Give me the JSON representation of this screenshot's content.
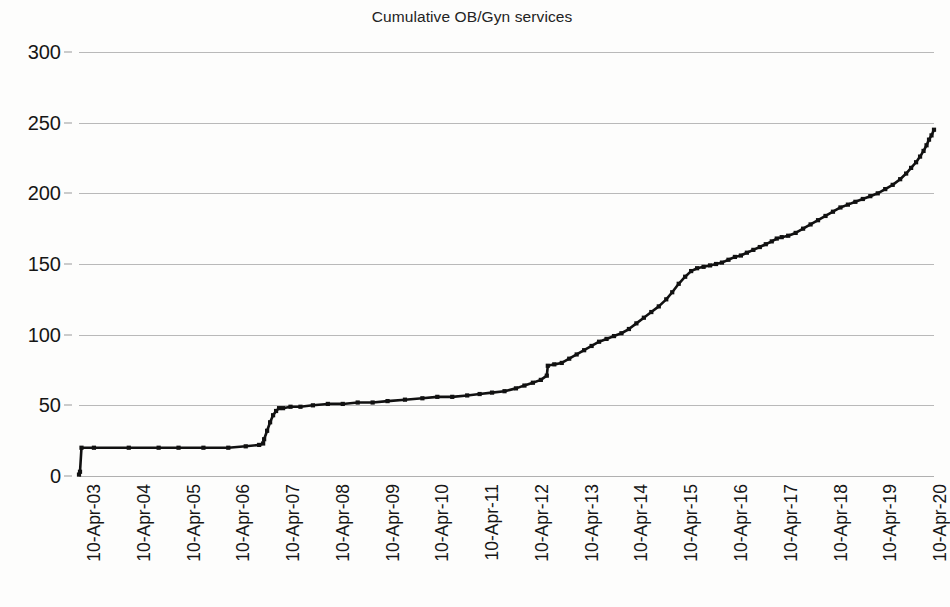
{
  "chart_data": {
    "type": "line",
    "title": "Cumulative OB/Gyn services",
    "xlabel": "",
    "ylabel": "",
    "ylim": [
      0,
      300
    ],
    "ytick_labels": [
      "0",
      "50",
      "100",
      "150",
      "200",
      "250",
      "300"
    ],
    "ytick_values": [
      0,
      50,
      100,
      150,
      200,
      250,
      300
    ],
    "grid": true,
    "legend": false,
    "legend_position": "none",
    "xlim": [
      "10-Apr-03",
      "10-Apr-20"
    ],
    "xtick_labels": [
      "10-Apr-03",
      "10-Apr-04",
      "10-Apr-05",
      "10-Apr-06",
      "10-Apr-07",
      "10-Apr-08",
      "10-Apr-09",
      "10-Apr-10",
      "10-Apr-11",
      "10-Apr-12",
      "10-Apr-13",
      "10-Apr-14",
      "10-Apr-15",
      "10-Apr-16",
      "10-Apr-17",
      "10-Apr-18",
      "10-Apr-19",
      "10-Apr-20"
    ],
    "series": [
      {
        "name": "Cumulative OB/Gyn services",
        "color": "#111111",
        "marker": "square",
        "x": [
          2003.0,
          2003.02,
          2003.05,
          2003.3,
          2004.0,
          2004.6,
          2005.0,
          2005.5,
          2006.0,
          2006.35,
          2006.62,
          2006.7,
          2006.72,
          2006.78,
          2006.84,
          2006.9,
          2006.96,
          2007.02,
          2007.1,
          2007.25,
          2007.45,
          2007.7,
          2008.0,
          2008.3,
          2008.6,
          2008.9,
          2009.2,
          2009.55,
          2009.9,
          2010.2,
          2010.5,
          2010.8,
          2011.05,
          2011.3,
          2011.55,
          2011.78,
          2011.95,
          2012.12,
          2012.28,
          2012.4,
          2012.42,
          2012.55,
          2012.7,
          2012.85,
          2013.0,
          2013.15,
          2013.3,
          2013.45,
          2013.6,
          2013.75,
          2013.9,
          2014.05,
          2014.2,
          2014.35,
          2014.5,
          2014.65,
          2014.8,
          2014.92,
          2015.05,
          2015.18,
          2015.3,
          2015.42,
          2015.55,
          2015.68,
          2015.8,
          2015.92,
          2016.05,
          2016.18,
          2016.3,
          2016.42,
          2016.55,
          2016.68,
          2016.8,
          2016.92,
          2017.02,
          2017.12,
          2017.25,
          2017.4,
          2017.55,
          2017.7,
          2017.85,
          2018.0,
          2018.15,
          2018.3,
          2018.45,
          2018.6,
          2018.75,
          2018.9,
          2019.05,
          2019.2,
          2019.35,
          2019.5,
          2019.62,
          2019.72,
          2019.82,
          2019.9,
          2019.97,
          2020.03,
          2020.08,
          2020.13,
          2020.18
        ],
        "y": [
          1,
          3,
          20,
          20,
          20,
          20,
          20,
          20,
          20,
          21,
          22,
          23,
          26,
          32,
          38,
          43,
          46,
          48,
          48,
          49,
          49,
          50,
          51,
          51,
          52,
          52,
          53,
          54,
          55,
          56,
          56,
          57,
          58,
          59,
          60,
          62,
          64,
          66,
          68,
          71,
          78,
          79,
          80,
          83,
          86,
          89,
          92,
          95,
          97,
          99,
          101,
          104,
          108,
          112,
          116,
          120,
          125,
          130,
          136,
          141,
          145,
          147,
          148,
          149,
          150,
          151,
          153,
          155,
          156,
          158,
          160,
          162,
          164,
          166,
          168,
          169,
          170,
          172,
          175,
          178,
          181,
          184,
          187,
          190,
          192,
          194,
          196,
          198,
          200,
          203,
          206,
          210,
          214,
          218,
          222,
          226,
          230,
          234,
          238,
          241,
          245
        ]
      }
    ]
  },
  "title": "Cumulative OB/Gyn services",
  "caption": ""
}
